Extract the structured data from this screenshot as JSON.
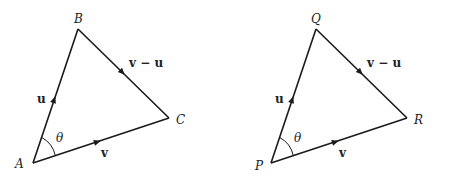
{
  "diagrams": [
    {
      "id": "left",
      "vertices": {
        "A": {
          "label": "A",
          "x": 33,
          "y": 163
        },
        "B": {
          "label": "B",
          "x": 78,
          "y": 29
        },
        "C": {
          "label": "C",
          "x": 169,
          "y": 118
        }
      },
      "edges": {
        "u": {
          "label": "u"
        },
        "v": {
          "label": "v"
        },
        "vu": {
          "label": "v − u"
        }
      },
      "angle": {
        "label": "θ"
      }
    },
    {
      "id": "right",
      "vertices": {
        "P": {
          "label": "P",
          "x": 271,
          "y": 163
        },
        "Q": {
          "label": "Q",
          "x": 316,
          "y": 29
        },
        "R": {
          "label": "R",
          "x": 407,
          "y": 118
        }
      },
      "edges": {
        "u": {
          "label": "u"
        },
        "v": {
          "label": "v"
        },
        "vu": {
          "label": "v − u"
        }
      },
      "angle": {
        "label": "θ"
      }
    }
  ],
  "colors": {
    "line": "#1a1a1a",
    "background": "#ffffff"
  }
}
